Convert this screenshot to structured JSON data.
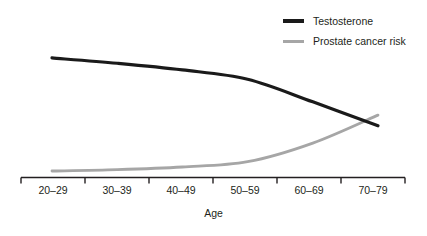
{
  "chart_data": {
    "type": "line",
    "title": "",
    "subtitle": "",
    "xlabel": "Age",
    "ylabel": "",
    "grid": false,
    "legend_position": "top-right",
    "categories": [
      "20–29",
      "30–39",
      "40–49",
      "50–59",
      "60–69",
      "70–79"
    ],
    "x": [
      1,
      2,
      3,
      4,
      5,
      6
    ],
    "xlim": [
      0.5,
      6.5
    ],
    "ylim": [
      0,
      100
    ],
    "y_axis_visible": false,
    "series": [
      {
        "name": "Testosterone",
        "color": "#1a1a1a",
        "line_width": 3.2,
        "values": [
          88,
          84,
          79,
          72,
          55,
          37
        ]
      },
      {
        "name": "Prostate cancer risk",
        "color": "#a6a6a6",
        "line_width": 2.8,
        "values": [
          3,
          4,
          6,
          10,
          24,
          45
        ]
      }
    ],
    "annotations": []
  },
  "legend": {
    "items": [
      {
        "label": "Testosterone",
        "color": "#1a1a1a"
      },
      {
        "label": "Prostate cancer risk",
        "color": "#a6a6a6"
      }
    ]
  },
  "axis": {
    "title": "Age",
    "tick_labels": [
      "20–29",
      "30–39",
      "40–49",
      "50–59",
      "60–69",
      "70–79"
    ],
    "line_color": "#231f20"
  },
  "colors": {
    "background": "#ffffff",
    "text": "#231f20",
    "testosterone": "#1a1a1a",
    "prostate_risk": "#a6a6a6"
  }
}
